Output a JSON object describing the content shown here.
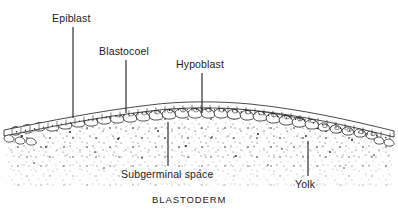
{
  "figure": {
    "caption": "BLASTODERM",
    "ink_color": "#1c1c1c",
    "background_color": "#ffffff",
    "stipple_color": "#3a3a3a"
  },
  "labels": [
    {
      "id": "epiblast",
      "text": "Epiblast",
      "x": 52,
      "y": 12,
      "leader": {
        "x": 73,
        "y1": 27,
        "y2": 118
      }
    },
    {
      "id": "blastocoel",
      "text": "Blastocoel",
      "x": 99,
      "y": 45,
      "leader": {
        "x": 126,
        "y1": 60,
        "y2": 113
      }
    },
    {
      "id": "hypoblast",
      "text": "Hypoblast",
      "x": 176,
      "y": 58,
      "leader": {
        "x": 202,
        "y1": 73,
        "y2": 113
      }
    },
    {
      "id": "subgerminal-space",
      "text": "Subgerminal space",
      "x": 121,
      "y": 168,
      "leader": {
        "x": 168,
        "y1": 122,
        "y2": 166
      }
    },
    {
      "id": "yolk",
      "text": "Yolk",
      "x": 295,
      "y": 178,
      "leader": {
        "x": 308,
        "y1": 141,
        "y2": 176
      }
    }
  ],
  "caption": {
    "text": "BLASTODERM",
    "x": 152,
    "y": 194
  },
  "structures": {
    "epiblast_layer": "upper continuous columnar cell sheet forming the arched roof of the blastoderm",
    "blastocoel": "narrow cavity between the epiblast and hypoblast layers",
    "hypoblast_layer": "lower discontinuous row of rounded cells beneath the blastocoel",
    "subgerminal_space": "clear space below the blastoderm above the yolk",
    "yolk": "stippled granular mass filling the lower region"
  }
}
